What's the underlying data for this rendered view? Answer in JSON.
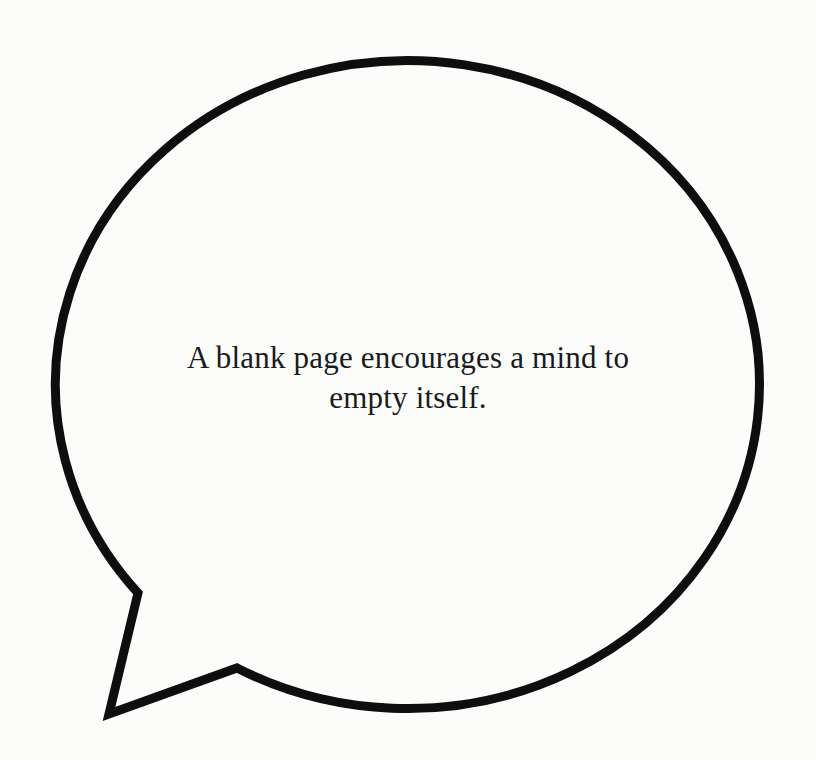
{
  "page": {
    "background_color": "#fcfcfb",
    "kind": "scanned illustration page"
  },
  "bubble": {
    "icon": "speech-bubble-icon",
    "outline_color": "#0e0e0e",
    "fill_color": "#fcfcfb",
    "text_color": "#1b1b1b",
    "quote_lines": {
      "0": "A blank page encourages a mind to",
      "1": "empty itself."
    },
    "quote_full": "A blank page encourages a mind to empty itself."
  }
}
